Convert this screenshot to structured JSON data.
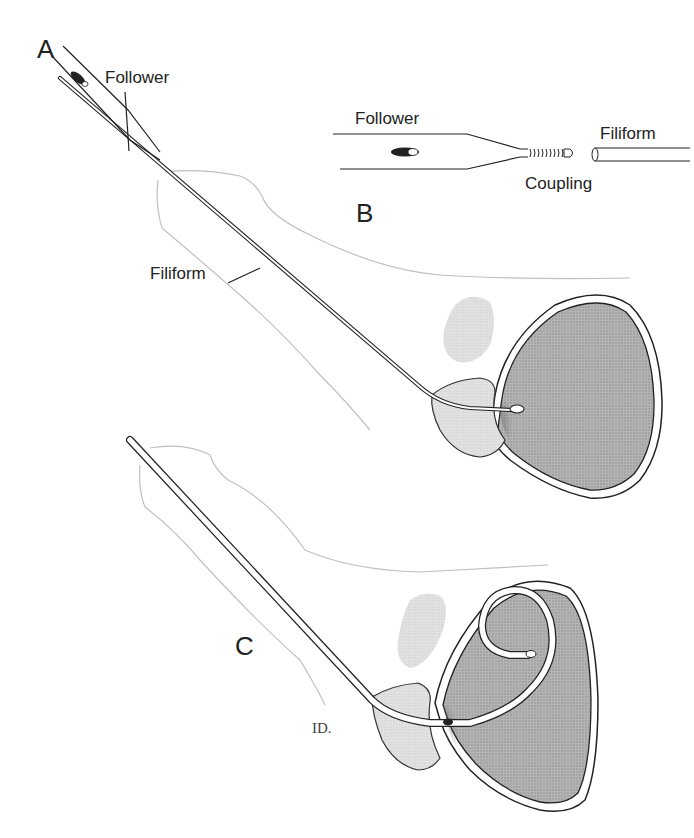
{
  "figure": {
    "panels": [
      {
        "id": "A",
        "label": "A"
      },
      {
        "id": "B",
        "label": "B"
      },
      {
        "id": "C",
        "label": "C"
      }
    ],
    "labels": {
      "a_follower": "Follower",
      "a_filiform": "Filiform",
      "b_follower": "Follower",
      "b_filiform": "Filiform",
      "b_coupling": "Coupling"
    },
    "signature": "ID.",
    "colors": {
      "line": "#222222",
      "outline_light": "#b8b8b8",
      "bladder_fill": "#a9a9a9",
      "prostate_fill": "#dcdcdc",
      "seminal_fill": "#cfcfcf"
    }
  }
}
